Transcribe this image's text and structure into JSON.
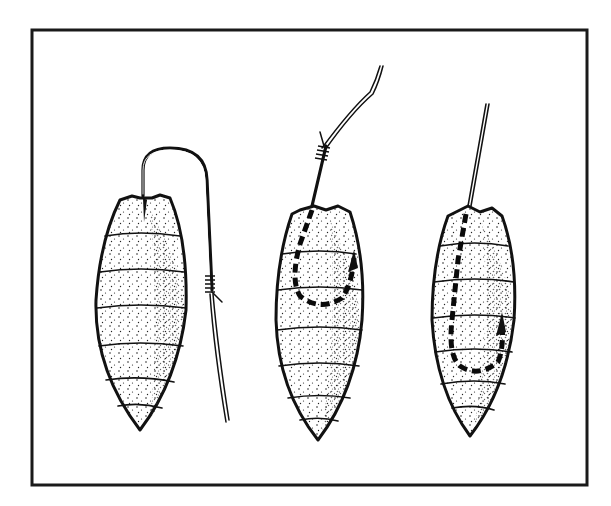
{
  "figure": {
    "colors": {
      "ink": "#111111",
      "background": "#ffffff"
    },
    "frame": {
      "x": 32,
      "y": 30,
      "width": 555,
      "height": 455
    },
    "panels": [
      {
        "id": "step-1",
        "label": "",
        "hook_visible": "outside",
        "line": "tied below hook eye, trailing down"
      },
      {
        "id": "step-2",
        "label": "",
        "hook_visible": "inside (dashed)",
        "line": "knotted above, rising"
      },
      {
        "id": "step-3",
        "label": "",
        "hook_visible": "inside (dashed)",
        "line": "straight up from head"
      }
    ]
  }
}
